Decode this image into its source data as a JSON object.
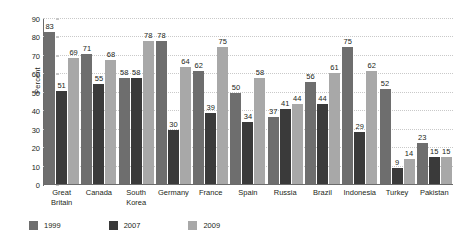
{
  "chart_data": {
    "type": "bar",
    "title": "",
    "xlabel": "",
    "ylabel": "Percent",
    "ylim": [
      0,
      90
    ],
    "ytick_step": 10,
    "yticks": [
      0,
      10,
      20,
      30,
      40,
      50,
      60,
      70,
      80,
      90
    ],
    "grid": true,
    "legend_position": "bottom-left",
    "categories": [
      "Great Britain",
      "Canada",
      "South Korea",
      "Germany",
      "France",
      "Spain",
      "Russia",
      "Brazil",
      "Indonesia",
      "Turkey",
      "Pakistan"
    ],
    "category_lines": [
      [
        "Great",
        "Britain"
      ],
      [
        "Canada"
      ],
      [
        "South",
        "Korea"
      ],
      [
        "Germany"
      ],
      [
        "France"
      ],
      [
        "Spain"
      ],
      [
        "Russia"
      ],
      [
        "Brazil"
      ],
      [
        "Indonesia"
      ],
      [
        "Turkey"
      ],
      [
        "Pakistan"
      ]
    ],
    "series": [
      {
        "name": "1999",
        "color": "#6e6e6e",
        "values": [
          83,
          71,
          58,
          78,
          62,
          50,
          37,
          56,
          75,
          52,
          23
        ]
      },
      {
        "name": "2007",
        "color": "#3a3a3a",
        "values": [
          51,
          55,
          58,
          30,
          39,
          34,
          41,
          44,
          29,
          9,
          15
        ]
      },
      {
        "name": "2009",
        "color": "#a8a8a8",
        "values": [
          69,
          68,
          78,
          64,
          75,
          58,
          44,
          61,
          62,
          14,
          15
        ]
      }
    ]
  },
  "colors": {
    "series_1999": "#6e6e6e",
    "series_2007": "#3a3a3a",
    "series_2009": "#a8a8a8",
    "gridline": "#c9c9c9",
    "axis": "#6b6b6b",
    "text": "#231f20",
    "background": "#ffffff"
  }
}
